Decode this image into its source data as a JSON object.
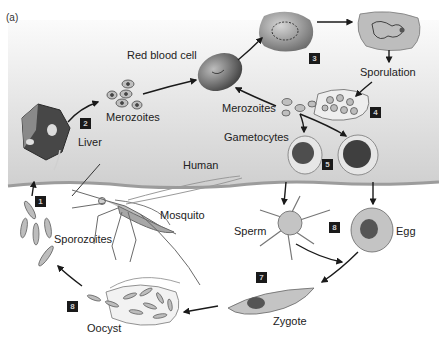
{
  "figure": {
    "panel_label": "(a)",
    "colors": {
      "human_bg_top": "#f7f7f7",
      "human_bg_bottom": "#d2d2d2",
      "skin_line": "#a9a9a9",
      "step_box": "#1a1a1a",
      "cell_fill": "#bdbdbd",
      "cell_dark": "#5a5a5a",
      "arrow": "#1a1a1a"
    }
  },
  "labels": {
    "red_blood_cell": "Red blood cell",
    "merozoites_liver": "Merozoites",
    "liver": "Liver",
    "sporulation": "Sporulation",
    "merozoites_blood": "Merozoites",
    "gametocytes": "Gametocytes",
    "human": "Human",
    "mosquito": "Mosquito",
    "sporozoites": "Sporozoites",
    "sperm": "Sperm",
    "egg": "Egg",
    "zygote": "Zygote",
    "oocyst": "Oocyst"
  },
  "steps": [
    {
      "id": "step-1",
      "number": "1"
    },
    {
      "id": "step-2",
      "number": "2"
    },
    {
      "id": "step-3",
      "number": "3"
    },
    {
      "id": "step-4",
      "number": "4"
    },
    {
      "id": "step-5",
      "number": "5"
    },
    {
      "id": "step-6",
      "number": "8"
    },
    {
      "id": "step-7",
      "number": "7"
    },
    {
      "id": "step-8",
      "number": "8"
    }
  ]
}
